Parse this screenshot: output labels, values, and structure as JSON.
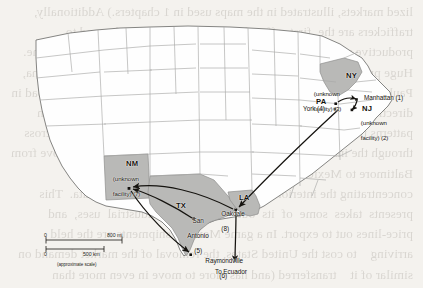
{
  "figure": {
    "type": "route-map",
    "region": "Continental United States",
    "scale_note": "(approximate scale)"
  },
  "ghost_text": "lized markets, illustrated in the maps used in 1 chapters.) Additionally, traffickers are the  first  offered, which are a integrate demand to productive value    address. For example, in the transit prices of cocaine. Huge price about the first    price zones are high- level markets (Tijuana, Paul, Francisco, New York),    Smugglers move the transit goods abroad in direction with the greatest    volume of trade demand, and distribution patterns that indicate cargo along    the highways of city state and across through the inside primitive. It is useful    in the way that drugs move from Baltimore to Mexico and more efficiently    corridor which is concentrating the interior (city) miles the base of facility    data.  This  presents  takes  some  of  its  out  economy  to  industrial  uses,  and    price-lines out to export. In a game Mexican shipments are the held arriving    to cost the United States, the removal of the market demand on similar of it    transferred (and has more to move in even more than higher), and they are    already easily  evidence  to  its  operation  and  movement  to  Right.  For  example,    John's Case (map support) was debated to the total of one and a half works to    just two places. He was apparently was onto the U.S. Marshals at a time to off-    most entry attempts or exporters, but remained the necessary paperwork to take",
  "states": [
    {
      "code": "NY",
      "name": "New York",
      "shaded": true
    },
    {
      "code": "PA",
      "name": "Pennsylvania",
      "shaded": false
    },
    {
      "code": "NJ",
      "name": "New Jersey",
      "shaded": false
    },
    {
      "code": "NM",
      "name": "New Mexico",
      "shaded": true
    },
    {
      "code": "TX",
      "name": "Texas",
      "shaded": true
    },
    {
      "code": "LA",
      "name": "Louisiana",
      "shaded": true
    }
  ],
  "state_labels": [
    {
      "text": "NY",
      "x": 346,
      "y": 76
    },
    {
      "text": "PA",
      "x": 318,
      "y": 104
    },
    {
      "text": "NJ",
      "x": 363,
      "y": 111
    },
    {
      "text": "NM",
      "x": 130,
      "y": 166
    },
    {
      "text": "TX",
      "x": 178,
      "y": 208
    },
    {
      "text": "LA",
      "x": 241,
      "y": 200
    }
  ],
  "nodes": [
    {
      "id": 1,
      "label": "Manhattan (1)",
      "stop": 1,
      "x": 357,
      "y": 100,
      "label_x": 365,
      "label_y": 98,
      "align": "left"
    },
    {
      "id": 2,
      "label": "(unknown facility) (2)",
      "stop": 2,
      "x": 352,
      "y": 110,
      "label_x": 354,
      "label_y": 114,
      "align": "left"
    },
    {
      "id": 3,
      "label": "(unknown facility) (3)",
      "stop": 3,
      "x": 336,
      "y": 104,
      "label_x": 306,
      "label_y": 87,
      "align": "left"
    },
    {
      "id": 4,
      "label": "York (4)",
      "stop": 4,
      "x": 335,
      "y": 108,
      "label_x": 307,
      "label_y": 108,
      "align": "left"
    },
    {
      "id": 5,
      "label": "San Antonio (5)",
      "stop": 5,
      "x": 194,
      "y": 219,
      "label_x": 196,
      "label_y": 216,
      "align": "left"
    },
    {
      "id": 6,
      "label": "Raymondville (6)",
      "stop": 6,
      "x": 191,
      "y": 255,
      "label_x": 196,
      "label_y": 252,
      "align": "left"
    },
    {
      "id": 7,
      "label": "(unknown facility) (7)",
      "stop": 7,
      "x": 129,
      "y": 188,
      "label_x": 105,
      "label_y": 172,
      "align": "left"
    },
    {
      "id": 8,
      "label": "Oakdale (8)",
      "stop": 8,
      "x": 236,
      "y": 210,
      "label_x": 218,
      "label_y": 207,
      "align": "left"
    }
  ],
  "node_labels": [
    {
      "lines": [
        "Manhattan (1)"
      ],
      "x": 366,
      "y": 96,
      "cls": "place"
    },
    {
      "lines": [
        "NJ"
      ],
      "x": 363,
      "y": 108,
      "cls": "state"
    },
    {
      "lines": [
        "(unknown",
        "facility) (2)"
      ],
      "x": 352,
      "y": 114,
      "cls": "facility"
    },
    {
      "lines": [
        "(unknown",
        "facility) (3)"
      ],
      "x": 305,
      "y": 86,
      "cls": "facility"
    },
    {
      "lines": [
        "PA"
      ],
      "x": 317,
      "y": 101,
      "cls": "state"
    },
    {
      "lines": [
        "York (4)"
      ],
      "x": 305,
      "y": 109,
      "cls": "place"
    },
    {
      "lines": [
        "NM"
      ],
      "x": 127,
      "y": 163,
      "cls": "state"
    },
    {
      "lines": [
        "(unknown",
        "facility) (7)"
      ],
      "x": 104,
      "y": 171,
      "cls": "facility"
    },
    {
      "lines": [
        "TX"
      ],
      "x": 176,
      "y": 205,
      "cls": "state"
    },
    {
      "lines": [
        "LA"
      ],
      "x": 239,
      "y": 197,
      "cls": "state"
    },
    {
      "lines": [
        "San",
        "Antonio",
        "(5)"
      ],
      "x": 191,
      "y": 212,
      "cls": "place"
    },
    {
      "lines": [
        "Oakdale",
        "(8)"
      ],
      "x": 216,
      "y": 205,
      "cls": "place"
    },
    {
      "lines": [
        "Raymondville",
        "(6)"
      ],
      "x": 197,
      "y": 251,
      "cls": "place"
    },
    {
      "lines": [
        "To Ecuador"
      ],
      "x": 217,
      "y": 270,
      "cls": "place"
    }
  ],
  "routes": [
    {
      "from": "York (4) / PA",
      "to": "Oakdale (8)",
      "desc": "northeast to Louisiana"
    },
    {
      "from": "Oakdale (8)",
      "to": "(unknown facility) (7) NM",
      "desc": "Louisiana to New Mexico"
    },
    {
      "from": "(unknown facility) (7) NM",
      "to": "Raymondville (6)",
      "desc": "New Mexico to south Texas"
    },
    {
      "from": "San Antonio (5)",
      "to": "(unknown facility) (7) NM",
      "desc": "San Antonio to New Mexico"
    },
    {
      "from": "Raymondville (6)",
      "to": "To Ecuador",
      "desc": "south Texas onward to Ecuador"
    },
    {
      "from": "(unknown facility) (3)",
      "to": "Manhattan (1)",
      "desc": "short northeast hop"
    },
    {
      "from": "Manhattan (1)",
      "to": "NJ (unknown facility) (2)",
      "desc": "Manhattan to New Jersey"
    }
  ],
  "destination_label": "To Ecuador",
  "scale_bar": {
    "miles": {
      "start": "0",
      "end": "800 mi",
      "value": 800,
      "unit": "mi"
    },
    "km": {
      "start": "0",
      "end": "500 km",
      "value": 500,
      "unit": "km"
    },
    "note": "(approximate scale)"
  },
  "colors": {
    "page_background": "#f4f2ee",
    "state_fill": "#ffffff",
    "state_shaded_fill": "#b9b9b7",
    "state_border": "#9a9a98",
    "coast_border": "#6f6f6d",
    "arrow": "#15130f",
    "text": "#12100d"
  }
}
